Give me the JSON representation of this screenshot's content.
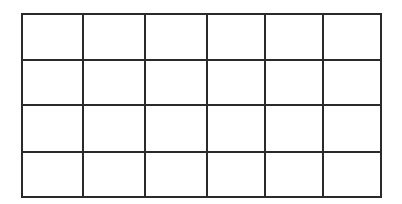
{
  "diagram": {
    "type": "empty-grid",
    "rows": 4,
    "columns": 6,
    "line_color": "#2a2a2a",
    "background": "#ffffff",
    "x_lines": [
      22,
      83,
      145,
      207,
      265,
      323,
      381
    ],
    "y_lines": [
      14,
      60,
      105,
      152,
      197
    ],
    "cells": [
      [
        "",
        "",
        "",
        "",
        "",
        ""
      ],
      [
        "",
        "",
        "",
        "",
        "",
        ""
      ],
      [
        "",
        "",
        "",
        "",
        "",
        ""
      ],
      [
        "",
        "",
        "",
        "",
        "",
        ""
      ]
    ]
  }
}
